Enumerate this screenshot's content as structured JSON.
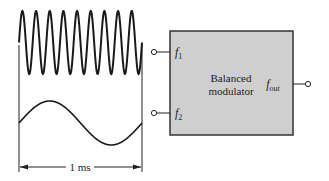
{
  "diagram": {
    "block": {
      "line1": "Balanced",
      "line2": "modulator",
      "fill": "#cfcfcf",
      "stroke": "#333333"
    },
    "inputs": [
      {
        "label_main": "f",
        "label_sub": "1"
      },
      {
        "label_main": "f",
        "label_sub": "2"
      }
    ],
    "output": {
      "label_main": "f",
      "label_sub": "out"
    },
    "waveforms": [
      {
        "name": "high-frequency-sine",
        "cycles": 9
      },
      {
        "name": "low-frequency-sine",
        "cycles": 1
      }
    ],
    "time_span_label": "1 ms"
  }
}
